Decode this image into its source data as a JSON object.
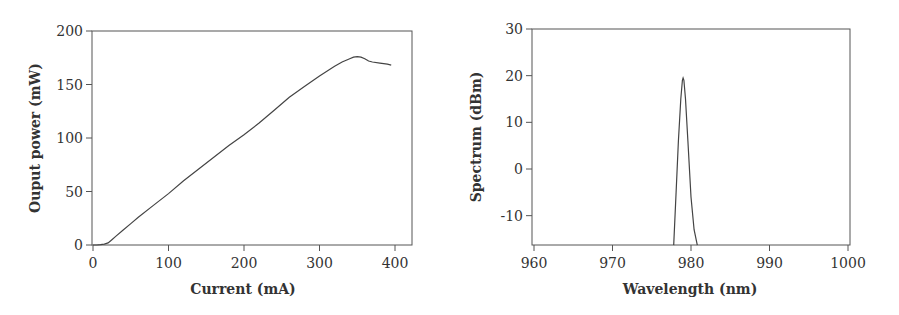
{
  "chart_data": [
    {
      "type": "line",
      "title": "",
      "xlabel": "Current (mA)",
      "ylabel": "Ouput power (mW)",
      "xlim": [
        0,
        420
      ],
      "ylim": [
        0,
        200
      ],
      "xticks": [
        0,
        100,
        200,
        300,
        400
      ],
      "yticks": [
        0,
        50,
        100,
        150,
        200
      ],
      "grid": false,
      "series": [
        {
          "name": "output power",
          "x": [
            0,
            5,
            10,
            15,
            20,
            25,
            30,
            40,
            50,
            60,
            80,
            100,
            120,
            140,
            160,
            180,
            200,
            220,
            240,
            260,
            280,
            300,
            320,
            330,
            340,
            345,
            350,
            355,
            360,
            365,
            370,
            380,
            390,
            395
          ],
          "y": [
            0,
            0,
            0.3,
            0.8,
            2,
            5,
            8,
            14,
            20,
            26,
            37,
            48,
            60,
            71,
            82,
            93,
            103,
            114,
            126,
            138,
            148,
            158,
            167,
            171,
            174,
            175.5,
            176,
            175.5,
            174,
            172,
            171,
            170,
            169,
            168
          ]
        }
      ]
    },
    {
      "type": "line",
      "title": "",
      "xlabel": "Wavelength (nm)",
      "ylabel": "Spectrum (dBm)",
      "xlim": [
        960,
        1000
      ],
      "ylim": [
        -16.3,
        30
      ],
      "xticks": [
        960,
        970,
        980,
        990,
        1000
      ],
      "yticks": [
        -10,
        0,
        10,
        20,
        30
      ],
      "grid": false,
      "series": [
        {
          "name": "spectrum",
          "x": [
            977.8,
            978.1,
            978.4,
            978.7,
            978.9,
            979.0,
            979.1,
            979.3,
            979.6,
            980.0,
            980.4,
            980.8
          ],
          "y": [
            -16.3,
            -5,
            6,
            15,
            19,
            19.5,
            19,
            15,
            6,
            -6,
            -13,
            -16.3
          ]
        }
      ]
    }
  ]
}
